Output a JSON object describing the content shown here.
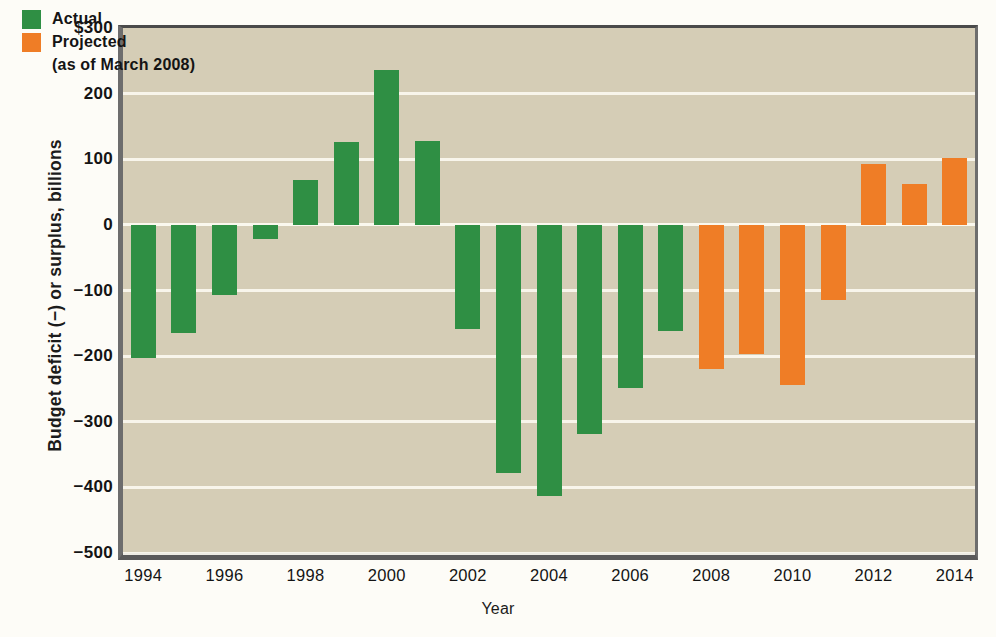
{
  "chart_data": {
    "type": "bar",
    "title": "",
    "xlabel": "Year",
    "ylabel": "Budget deficit (−) or surplus, billions",
    "ylim": [
      -500,
      300
    ],
    "yticks": [
      "$300",
      "200",
      "100",
      "0",
      "−100",
      "−200",
      "−300",
      "−400",
      "−500"
    ],
    "ytick_values": [
      300,
      200,
      100,
      0,
      -100,
      -200,
      -300,
      -400,
      -500
    ],
    "xticks": [
      "1994",
      "1996",
      "1998",
      "2000",
      "2002",
      "2004",
      "2006",
      "2008",
      "2010",
      "2012",
      "2014"
    ],
    "grid": true,
    "legend_position": "top-left",
    "series": [
      {
        "name": "Actual",
        "color": "#2f8f44",
        "x": [
          1994,
          1995,
          1996,
          1997,
          1998,
          1999,
          2000,
          2001,
          2002,
          2003,
          2004,
          2005,
          2006,
          2007
        ],
        "values": [
          -203,
          -164,
          -107,
          -22,
          69,
          126,
          236,
          128,
          -158,
          -378,
          -413,
          -318,
          -248,
          -161
        ]
      },
      {
        "name": "Projected",
        "color": "#ef7d26",
        "x": [
          2008,
          2009,
          2010,
          2011,
          2012,
          2013,
          2014
        ],
        "values": [
          -219,
          -196,
          -244,
          -115,
          93,
          63,
          102
        ]
      }
    ],
    "categories": [
      1994,
      1995,
      1996,
      1997,
      1998,
      1999,
      2000,
      2001,
      2002,
      2003,
      2004,
      2005,
      2006,
      2007,
      2008,
      2009,
      2010,
      2011,
      2012,
      2013,
      2014
    ],
    "values": [
      -203,
      -164,
      -107,
      -22,
      69,
      126,
      236,
      128,
      -158,
      -378,
      -413,
      -318,
      -248,
      -161,
      -219,
      -196,
      -244,
      -115,
      93,
      63,
      102
    ],
    "bar_types": [
      "actual",
      "actual",
      "actual",
      "actual",
      "actual",
      "actual",
      "actual",
      "actual",
      "actual",
      "actual",
      "actual",
      "actual",
      "actual",
      "actual",
      "projected",
      "projected",
      "projected",
      "projected",
      "projected",
      "projected",
      "projected"
    ]
  },
  "legend": {
    "actual_label": "Actual",
    "projected_label": "Projected",
    "projected_sub": "(as of March 2008)"
  },
  "colors": {
    "actual": "#2f8f44",
    "projected": "#ef7d26",
    "plot_background": "#d5cdb6",
    "page_background": "#fdfcf7",
    "gridline": "#fbf9f0"
  }
}
